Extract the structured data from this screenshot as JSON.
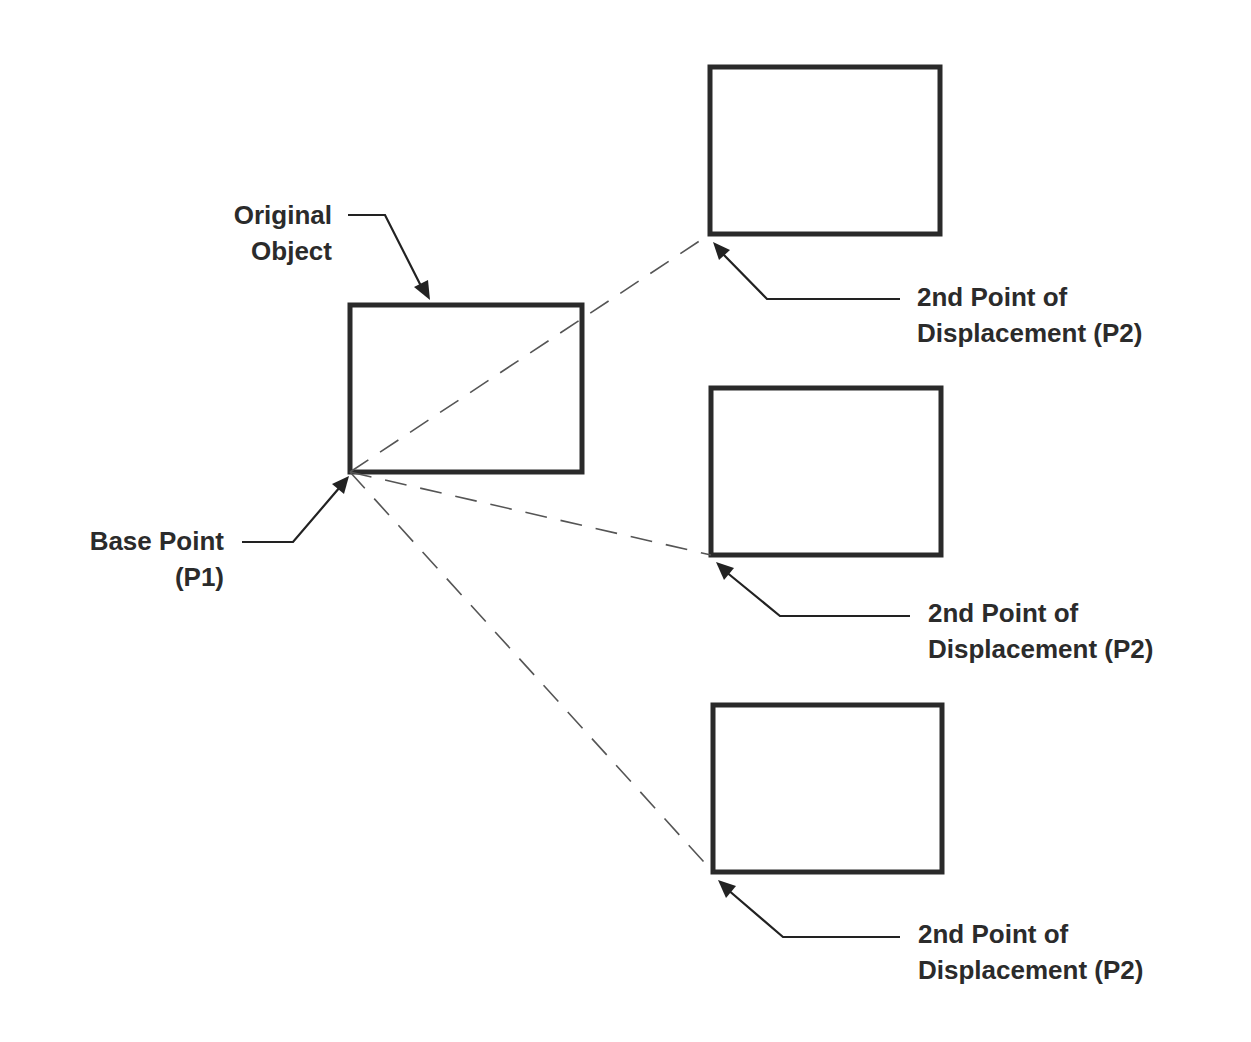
{
  "diagram": {
    "colors": {
      "stroke": "#2a2a2a",
      "dash": "#555555",
      "text": "#2b2b2b",
      "background": "#ffffff"
    },
    "labels": {
      "original_object": {
        "line1": "Original",
        "line2": "Object"
      },
      "base_point": {
        "line1": "Base Point",
        "line2": "(P1)"
      },
      "p2_top": {
        "line1": "2nd Point of",
        "line2": "Displacement (P2)"
      },
      "p2_middle": {
        "line1": "2nd Point of",
        "line2": "Displacement (P2)"
      },
      "p2_bottom": {
        "line1": "2nd Point of",
        "line2": "Displacement (P2)"
      }
    },
    "shapes": [
      {
        "name": "original-object-rectangle",
        "x": 350,
        "y": 305,
        "w": 232,
        "h": 167
      },
      {
        "name": "copy-top-rectangle",
        "x": 710,
        "y": 67,
        "w": 230,
        "h": 167
      },
      {
        "name": "copy-middle-rectangle",
        "x": 711,
        "y": 388,
        "w": 230,
        "h": 167
      },
      {
        "name": "copy-bottom-rectangle",
        "x": 713,
        "y": 705,
        "w": 229,
        "h": 167
      }
    ]
  }
}
